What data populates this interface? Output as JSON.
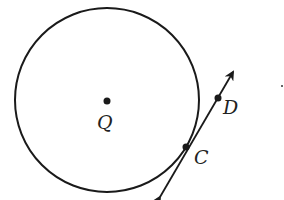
{
  "diagram": {
    "type": "geometry-circle-tangent",
    "colors": {
      "stroke": "#1a1a1a",
      "background": "#ffffff",
      "text": "#222222"
    },
    "circle": {
      "center_label": "Q",
      "cx": 107,
      "cy": 100,
      "r": 92
    },
    "points": [
      {
        "id": "Q",
        "label": "Q",
        "x": 107,
        "y": 101,
        "label_x": 97,
        "label_y": 129
      },
      {
        "id": "C",
        "label": "C",
        "x": 186,
        "y": 147,
        "label_x": 194,
        "label_y": 164
      },
      {
        "id": "D",
        "label": "D",
        "x": 218,
        "y": 98,
        "label_x": 223,
        "label_y": 114
      }
    ],
    "tangent_line": {
      "through": [
        "C",
        "D"
      ],
      "start": {
        "x": 160,
        "y": 197
      },
      "end": {
        "x": 233,
        "y": 72
      },
      "arrows": "both"
    },
    "stray_mark": {
      "x": 282,
      "y": 86
    }
  }
}
